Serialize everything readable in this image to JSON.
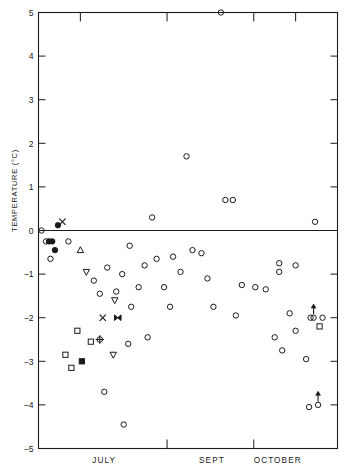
{
  "chart_data": {
    "type": "scatter",
    "title": "",
    "xlabel": "",
    "ylabel": "TEMPERATURE (°C)",
    "ylim": [
      -5,
      5
    ],
    "xlim": [
      0,
      100
    ],
    "grid": false,
    "legend": "none",
    "zero_line": true,
    "ytick_labels": [
      "5",
      "4",
      "3",
      "2",
      "1",
      "0",
      "−1",
      "−2",
      "−3",
      "−4",
      "−5"
    ],
    "ytick_values": [
      5,
      4,
      3,
      2,
      1,
      0,
      -1,
      -2,
      -3,
      -4,
      -5
    ],
    "xtick_labels": [
      "JULY",
      "SEPT",
      "OCTOBER"
    ],
    "xtick_label_positions": [
      22,
      58,
      80
    ],
    "xtick_positions_top": [
      14,
      43,
      72,
      86
    ],
    "xtick_positions_bottom": [
      43,
      72
    ],
    "series": [
      {
        "name": "open-circle",
        "marker": "open-circle",
        "points": [
          [
            61.0,
            5.0
          ],
          [
            1.0,
            0.0
          ],
          [
            2.5,
            -0.25
          ],
          [
            10.0,
            -0.25
          ],
          [
            4.0,
            -0.65
          ],
          [
            49.5,
            1.7
          ],
          [
            38.0,
            0.3
          ],
          [
            62.5,
            0.7
          ],
          [
            65.0,
            0.7
          ],
          [
            92.5,
            0.2
          ],
          [
            30.5,
            -0.35
          ],
          [
            23.0,
            -0.85
          ],
          [
            39.5,
            -0.65
          ],
          [
            45.0,
            -0.6
          ],
          [
            51.5,
            -0.45
          ],
          [
            54.5,
            -0.52
          ],
          [
            35.5,
            -0.8
          ],
          [
            47.5,
            -0.95
          ],
          [
            56.5,
            -1.1
          ],
          [
            28.0,
            -1.0
          ],
          [
            18.5,
            -1.15
          ],
          [
            80.5,
            -0.75
          ],
          [
            80.5,
            -0.95
          ],
          [
            86.0,
            -0.8
          ],
          [
            20.5,
            -1.45
          ],
          [
            26.0,
            -1.4
          ],
          [
            33.5,
            -1.3
          ],
          [
            42.0,
            -1.3
          ],
          [
            68.0,
            -1.25
          ],
          [
            72.5,
            -1.3
          ],
          [
            76.0,
            -1.35
          ],
          [
            31.0,
            -1.75
          ],
          [
            44.0,
            -1.75
          ],
          [
            58.5,
            -1.75
          ],
          [
            66.0,
            -1.95
          ],
          [
            84.0,
            -1.9
          ],
          [
            91.0,
            -2.0
          ],
          [
            95.0,
            -2.0
          ],
          [
            79.0,
            -2.45
          ],
          [
            86.0,
            -2.3
          ],
          [
            81.5,
            -2.75
          ],
          [
            89.5,
            -2.95
          ],
          [
            30.0,
            -2.6
          ],
          [
            36.5,
            -2.45
          ],
          [
            22.0,
            -3.7
          ],
          [
            28.5,
            -4.45
          ],
          [
            90.5,
            -4.05
          ]
        ]
      },
      {
        "name": "filled-circle",
        "marker": "filled-circle",
        "points": [
          [
            6.5,
            0.12
          ],
          [
            3.5,
            -0.25
          ],
          [
            4.6,
            -0.25
          ],
          [
            5.5,
            -0.45
          ]
        ]
      },
      {
        "name": "cross-x",
        "marker": "x",
        "points": [
          [
            8.0,
            0.2
          ],
          [
            21.5,
            -2.0
          ]
        ]
      },
      {
        "name": "open-square",
        "marker": "open-square",
        "points": [
          [
            13.0,
            -2.3
          ],
          [
            17.5,
            -2.55
          ],
          [
            9.0,
            -2.85
          ],
          [
            11.0,
            -3.15
          ],
          [
            94.0,
            -2.2
          ]
        ]
      },
      {
        "name": "filled-square",
        "marker": "filled-square",
        "points": [
          [
            14.5,
            -3.0
          ]
        ]
      },
      {
        "name": "up-triangle",
        "marker": "up-triangle",
        "points": [
          [
            14.0,
            -0.45
          ]
        ]
      },
      {
        "name": "down-triangle",
        "marker": "down-triangle",
        "points": [
          [
            16.0,
            -0.95
          ],
          [
            25.5,
            -1.6
          ],
          [
            25.0,
            -2.85
          ]
        ]
      },
      {
        "name": "crossed-circle",
        "marker": "crossed-circle",
        "points": [
          [
            20.5,
            -2.5
          ]
        ]
      },
      {
        "name": "bowtie",
        "marker": "bowtie",
        "points": [
          [
            26.5,
            -2.0
          ]
        ]
      },
      {
        "name": "circle-up-arrow",
        "marker": "circle-with-up-arrow",
        "points": [
          [
            92.0,
            -2.0
          ],
          [
            93.5,
            -4.0
          ]
        ]
      }
    ],
    "annotations": [
      {
        "text": "upward arrows denote lower limits",
        "kind": "marker-meaning"
      }
    ]
  },
  "caption": {
    "line": ""
  }
}
